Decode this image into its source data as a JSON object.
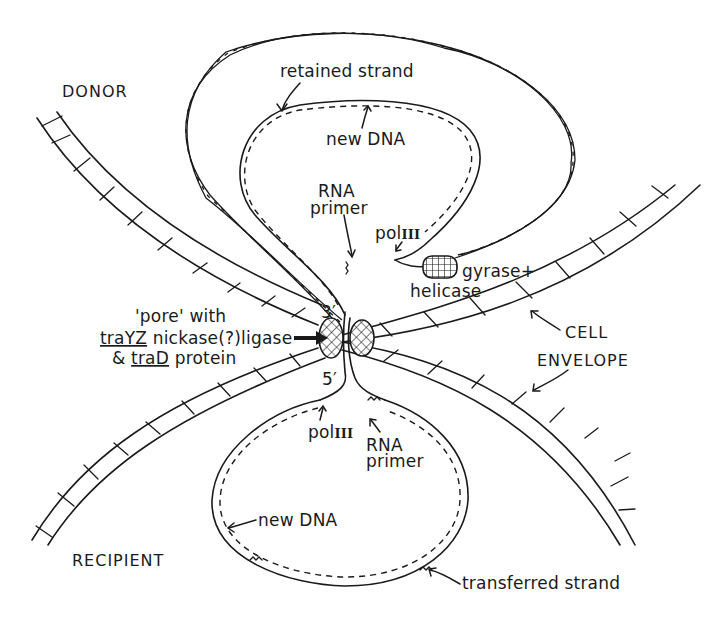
{
  "diagram": {
    "regions": {
      "donor": "DONOR",
      "recipient": "RECIPIENT"
    },
    "labels": {
      "retained_strand": "retained strand",
      "new_dna_top": "new DNA",
      "rna_primer_top_line1": "RNA",
      "rna_primer_top_line2": "primer",
      "pol_iii_top_prefix": "pol",
      "pol_iii_top_numeral": "III",
      "gyrase": "gyrase+",
      "helicase": "helicase",
      "pore_line1": "'pore' with",
      "pore_line2_gene": "traYZ",
      "pore_line2_rest": " nickase(?)ligase",
      "pore_line3_prefix": "& ",
      "pore_line3_gene": "traD",
      "pore_line3_rest": " protein",
      "three_prime": "3′",
      "five_prime": "5′",
      "cell": "CELL",
      "envelope": "ENVELOPE",
      "pol_iii_bottom_prefix": "pol",
      "pol_iii_bottom_numeral": "III",
      "rna_primer_bottom_line1": "RNA",
      "rna_primer_bottom_line2": "primer",
      "new_dna_bottom": "new DNA",
      "transferred_strand": "transferred strand"
    },
    "colors": {
      "ink": "#1a1a1a",
      "background": "#ffffff"
    }
  }
}
